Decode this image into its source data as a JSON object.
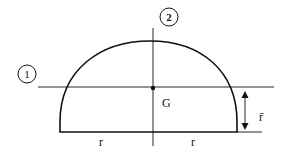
{
  "diagram": {
    "axes": [
      {
        "id": "1",
        "label": "1",
        "orientation": "horizontal",
        "through": "G"
      },
      {
        "id": "2",
        "label": "2",
        "orientation": "vertical",
        "through": "G"
      }
    ],
    "centroid_label": "G",
    "dimension_label": "r̄",
    "base_labels": [
      "r",
      "r"
    ],
    "colors": {
      "stroke": "#111111",
      "background": "#ffffff"
    }
  }
}
